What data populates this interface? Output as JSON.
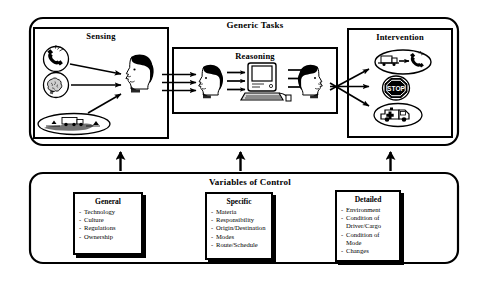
{
  "diagram": {
    "top_panel": {
      "title": "Generic Tasks",
      "sensing": {
        "title": "Sensing",
        "icons": [
          "telephone-icon",
          "brain-head-icon",
          "truck-landscape-icon"
        ],
        "actor": "human-head-profile"
      },
      "reasoning": {
        "title": "Reasoning",
        "actor_left": "human-head-profile",
        "machine": "desktop-computer",
        "actor_right": "human-head-profile",
        "arrow_groups": 3
      },
      "intervention": {
        "title": "Intervention",
        "icons": [
          "truck-to-telephone-icon",
          "stop-sign-icon",
          "ambulance-icon"
        ],
        "stop_label": "STOP"
      }
    },
    "connector_arrows": 3,
    "bottom_panel": {
      "title": "Variables of Control",
      "boxes": [
        {
          "title": "General",
          "items": [
            "Technology",
            "Culture",
            "Regulations",
            "Ownership"
          ]
        },
        {
          "title": "Specific",
          "items": [
            "Materia",
            "Responsibility",
            "Origin/Destination",
            "Modes",
            "Route/Schedule"
          ]
        },
        {
          "title": "Detailed",
          "items": [
            "Environment",
            "Condition of",
            "Driver/Cargo",
            "Condition of",
            "Mode",
            "Changes"
          ]
        }
      ]
    }
  },
  "colors": {
    "ink": "#000000",
    "paper": "#ffffff"
  }
}
